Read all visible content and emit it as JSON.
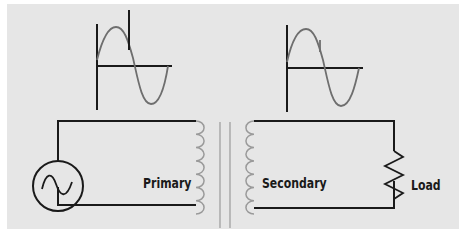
{
  "diagram": {
    "type": "transformer-circuit",
    "labels": {
      "primary": "Primary",
      "secondary": "Secondary",
      "load": "Load"
    },
    "components": [
      {
        "name": "ac-source",
        "symbol": "circle-with-sine"
      },
      {
        "name": "primary-coil",
        "turns": 7
      },
      {
        "name": "iron-core",
        "lines": 2
      },
      {
        "name": "secondary-coil",
        "turns": 7
      },
      {
        "name": "load-resistor",
        "symbol": "zigzag"
      }
    ],
    "waveforms": [
      {
        "name": "primary-waveform",
        "shape": "sine-with-spike"
      },
      {
        "name": "secondary-waveform",
        "shape": "sine-with-small-spike"
      }
    ],
    "colors": {
      "background": "#e6e6e6",
      "wire": "#1a1a1a",
      "waveform": "#6e6e6e",
      "coil": "#9a9a9a"
    }
  }
}
